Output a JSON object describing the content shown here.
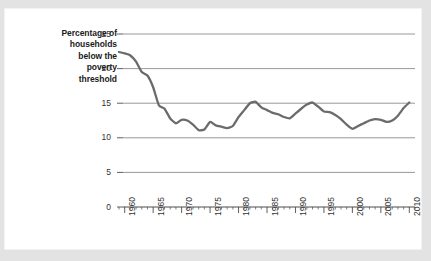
{
  "figure": {
    "background_color": "#e3e3e3",
    "panel_color": "#ffffff",
    "line_color": "#6b6b6b",
    "grid_color": "#8c8c8c",
    "axis_color": "#4d4d4d",
    "text_color": "#333333",
    "label_color": "#1b1b1b"
  },
  "ylabel_lines": [
    "Percentage of",
    "households",
    "below the",
    "poverty",
    "threshold"
  ],
  "chart_data": {
    "type": "line",
    "title": "",
    "subtitle": "",
    "xlabel": "",
    "ylabel": "Percentage of households below the poverty threshold",
    "xlim": [
      1959,
      2011
    ],
    "ylim": [
      0,
      25
    ],
    "grid": true,
    "grid_axis": "y",
    "legend": false,
    "legend_position": "none",
    "yticks": [
      0,
      5,
      10,
      15,
      20,
      25
    ],
    "ytick_labels": [
      "0",
      "5",
      "10",
      "15",
      "20",
      "25"
    ],
    "xticks": [
      1960,
      1965,
      1970,
      1975,
      1980,
      1985,
      1990,
      1995,
      2000,
      2005,
      2010
    ],
    "xtick_labels": [
      "1960",
      "1965",
      "1970",
      "1975",
      "1980",
      "1985",
      "1990",
      "1995",
      "2000",
      "2005",
      "2010"
    ],
    "xtick_rotation": 90,
    "xtick_minor_interval": 1,
    "series": [
      {
        "name": "Percentage of households below the poverty threshold",
        "color": "#6b6b6b",
        "x": [
          1959,
          1960,
          1961,
          1962,
          1963,
          1964,
          1965,
          1966,
          1967,
          1968,
          1969,
          1970,
          1971,
          1972,
          1973,
          1974,
          1975,
          1976,
          1977,
          1978,
          1979,
          1980,
          1981,
          1982,
          1983,
          1984,
          1985,
          1986,
          1987,
          1988,
          1989,
          1990,
          1991,
          1992,
          1993,
          1994,
          1995,
          1996,
          1997,
          1998,
          1999,
          2000,
          2001,
          2002,
          2003,
          2004,
          2005,
          2006,
          2007,
          2008,
          2009,
          2010
        ],
        "values": [
          22.4,
          22.2,
          21.9,
          21.0,
          19.5,
          19.0,
          17.3,
          14.7,
          14.2,
          12.8,
          12.1,
          12.6,
          12.5,
          11.9,
          11.1,
          11.2,
          12.3,
          11.8,
          11.6,
          11.4,
          11.7,
          13.0,
          14.0,
          15.0,
          15.2,
          14.4,
          14.0,
          13.6,
          13.4,
          13.0,
          12.8,
          13.5,
          14.2,
          14.8,
          15.1,
          14.5,
          13.8,
          13.7,
          13.3,
          12.7,
          11.9,
          11.3,
          11.7,
          12.1,
          12.5,
          12.7,
          12.6,
          12.3,
          12.5,
          13.2,
          14.3,
          15.1
        ],
        "notes": [
          {
            "label": "series start",
            "x": 1959,
            "y": 22.4
          },
          {
            "label": "steep decline through the 1960s",
            "x": 1966,
            "y": 14.7
          },
          {
            "label": "early-1970s trough",
            "x": 1973,
            "y": 11.1
          },
          {
            "label": "early-1980s peak",
            "x": 1983,
            "y": 15.2
          },
          {
            "label": "early-1990s peak",
            "x": 1993,
            "y": 15.1
          },
          {
            "label": "2000 trough",
            "x": 2000,
            "y": 11.3
          },
          {
            "label": "series end",
            "x": 2010,
            "y": 15.1
          }
        ]
      }
    ]
  }
}
